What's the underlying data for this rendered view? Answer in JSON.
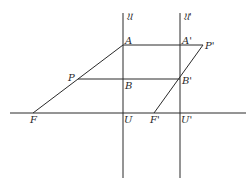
{
  "diagram": {
    "type": "geometric-construction",
    "lines": {
      "vertical_left": {
        "name": "𝔘",
        "x": 123,
        "y1": 13,
        "y2": 178
      },
      "vertical_right": {
        "name": "𝔘'",
        "x": 180,
        "y1": 13,
        "y2": 178
      },
      "baseline": {
        "y": 113,
        "x1": 10,
        "x2": 246
      },
      "AP_prime": {
        "from": "A",
        "to": "P'"
      },
      "PB_prime": {
        "from": "P",
        "to": "B'"
      },
      "FA": {
        "from": "F",
        "to": "A"
      },
      "F_prime_P_prime": {
        "from": "F'",
        "to": "P'"
      }
    },
    "points": {
      "A": {
        "label": "A",
        "x": 123,
        "y": 45
      },
      "A_prime": {
        "label": "A'",
        "x": 180,
        "y": 45
      },
      "P_prime": {
        "label": "P'",
        "x": 203,
        "y": 45
      },
      "P": {
        "label": "P",
        "x": 78,
        "y": 79
      },
      "B": {
        "label": "B",
        "x": 123,
        "y": 79
      },
      "B_prime": {
        "label": "B'",
        "x": 180,
        "y": 79
      },
      "F": {
        "label": "F",
        "x": 33,
        "y": 113
      },
      "U": {
        "label": "U",
        "x": 123,
        "y": 113
      },
      "F_prime": {
        "label": "F'",
        "x": 154,
        "y": 113
      },
      "U_prime": {
        "label": "U'",
        "x": 180,
        "y": 113
      }
    },
    "axis_labels": {
      "left": "𝔘",
      "right": "𝔘'"
    },
    "stroke_color": "#2a2a2a",
    "background": "#ffffff"
  }
}
